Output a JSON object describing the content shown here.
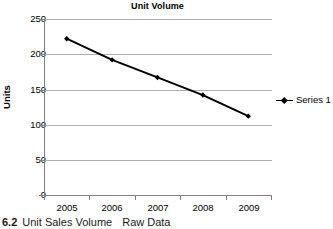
{
  "chart_data": {
    "type": "line",
    "title": "Unit Volume",
    "xlabel": "",
    "ylabel": "Units",
    "categories": [
      "2005",
      "2006",
      "2007",
      "2008",
      "2009"
    ],
    "series": [
      {
        "name": "Series 1",
        "values": [
          222,
          192,
          167,
          142,
          112
        ],
        "color": "#000000",
        "marker": "diamond"
      }
    ],
    "ylim": [
      0,
      250
    ],
    "yticks": [
      0,
      50,
      100,
      150,
      200,
      250
    ],
    "ytick_labels": [
      "0",
      "50",
      "100",
      "150",
      "200",
      "250"
    ],
    "grid": "horizontal",
    "legend_position": "right"
  },
  "legend": {
    "entries": [
      {
        "label": "Series 1"
      }
    ]
  },
  "caption": {
    "number": "6.2",
    "text": "Unit Sales Volume",
    "subtext": "Raw Data"
  }
}
